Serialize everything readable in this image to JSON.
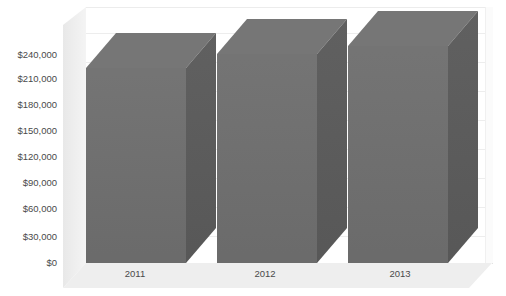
{
  "chart_data": {
    "type": "bar",
    "title": "",
    "subtitle": "",
    "xlabel": "",
    "ylabel": "",
    "categories": [
      "2011",
      "2012",
      "2013"
    ],
    "values": [
      225000,
      236000,
      244000
    ],
    "series": [
      {
        "name": "",
        "values": [
          225000,
          236000,
          244000
        ]
      }
    ],
    "ylim": [
      0,
      240000
    ],
    "ytick_step": 30000,
    "ytick_labels": [
      "$240,000",
      "$210,000",
      "$180,000",
      "$150,000",
      "$120,000",
      "$90,000",
      "$60,000",
      "$30,000",
      "$0"
    ],
    "ytick_values": [
      240000,
      210000,
      180000,
      150000,
      120000,
      90000,
      60000,
      30000,
      0
    ],
    "xtick_labels": [
      "2011",
      "2012",
      "2013"
    ],
    "grid": true,
    "grid_axis": "y",
    "legend": false,
    "legend_position": "none",
    "three_d": true,
    "annotations": [],
    "colors": {
      "bar_front": "#6e6e6e",
      "bar_side": "#5b5b5b",
      "bar_top": "#767676",
      "back_wall": "#ffffff",
      "left_wall": "#ececec",
      "floor": "#eeeeee",
      "gridline": "#ededed",
      "tick_text": "#4a4a4a",
      "background": "#ffffff"
    }
  },
  "axes": {
    "y": {
      "ticks": [
        {
          "label": "$240,000",
          "top": 50
        },
        {
          "label": "$210,000",
          "top": 74
        },
        {
          "label": "$180,000",
          "top": 100
        },
        {
          "label": "$150,000",
          "top": 126
        },
        {
          "label": "$120,000",
          "top": 152
        },
        {
          "label": "$90,000",
          "top": 178
        },
        {
          "label": "$60,000",
          "top": 204
        },
        {
          "label": "$30,000",
          "top": 232
        },
        {
          "label": "$0",
          "top": 258
        }
      ]
    },
    "x": {
      "ticks": [
        {
          "label": "2011",
          "left": 80
        },
        {
          "label": "2012",
          "left": 210
        },
        {
          "label": "2013",
          "left": 345
        }
      ]
    }
  },
  "gridlines": [
    {
      "top": 25
    },
    {
      "top": 54
    },
    {
      "top": 83
    },
    {
      "top": 112
    },
    {
      "top": 141
    },
    {
      "top": 170
    },
    {
      "top": 199
    },
    {
      "top": 228
    }
  ],
  "bars": [
    {
      "category": "2011",
      "value": 225000,
      "value_label": "$225,000",
      "geom": {
        "left": 86,
        "top": 33,
        "front_w": 100,
        "front_h": 195,
        "front_top": 35,
        "depth_x": 30,
        "depth_y": 35
      }
    },
    {
      "category": "2012",
      "value": 236000,
      "value_label": "$236,000",
      "geom": {
        "left": 217,
        "top": 19,
        "front_w": 100,
        "front_h": 209,
        "front_top": 35,
        "depth_x": 30,
        "depth_y": 35
      }
    },
    {
      "category": "2013",
      "value": 244000,
      "value_label": "$244,000",
      "geom": {
        "left": 348,
        "top": 11,
        "front_w": 100,
        "front_h": 217,
        "front_top": 35,
        "depth_x": 30,
        "depth_y": 35
      }
    }
  ]
}
